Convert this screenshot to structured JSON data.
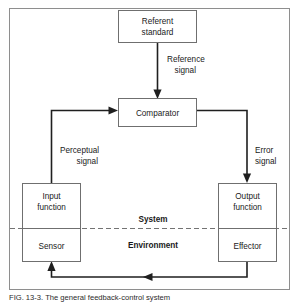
{
  "figure": {
    "type": "control-system-feedback-diagram",
    "caption": "FIG. 13-3.  The general feedback-control system"
  },
  "frame": {
    "border_color": "#8e8e8e"
  },
  "nodes": {
    "referent_standard": {
      "line1": "Referent",
      "line2": "standard"
    },
    "comparator": {
      "line1": "Comparator"
    },
    "input_function": {
      "line1": "Input",
      "line2": "function"
    },
    "sensor": {
      "line1": "Sensor"
    },
    "output_function": {
      "line1": "Output",
      "line2": "function"
    },
    "effector": {
      "line1": "Effector"
    }
  },
  "edge_labels": {
    "reference_signal": {
      "line1": "Reference",
      "line2": "signal"
    },
    "perceptual_signal": {
      "line1": "Perceptual",
      "line2": "signal"
    },
    "error_signal": {
      "line1": "Error",
      "line2": "signal"
    }
  },
  "regions": {
    "system": "System",
    "environment": "Environment"
  },
  "colors": {
    "line": "#1f1f1f",
    "box_stroke": "#6f6f6f",
    "frame_stroke": "#8e8e8e",
    "dashed": "#737373",
    "text": "#1a1a1a",
    "background": "#ffffff"
  }
}
